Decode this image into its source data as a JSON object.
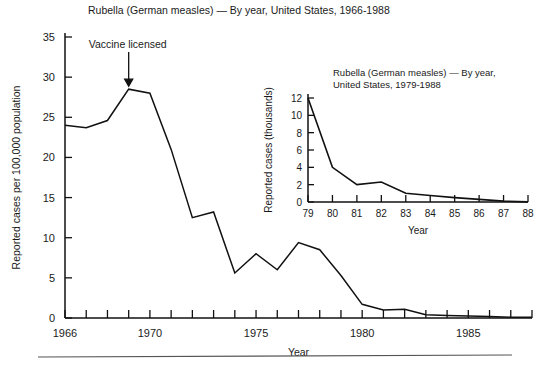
{
  "figure": {
    "background": "#ffffff",
    "ink_color": "#111111",
    "bottom_rule": true
  },
  "chart_data": [
    {
      "id": "main",
      "type": "line",
      "title": "Rubella (German measles) — By year, United States, 1966-1988",
      "xlabel": "Year",
      "ylabel": "Reported cases per 100,000 population",
      "xlim": [
        1966,
        1988
      ],
      "ylim": [
        0,
        35
      ],
      "ytick_labels": [
        "0",
        "5",
        "10",
        "15",
        "20",
        "25",
        "30",
        "35"
      ],
      "ytick_values": [
        0,
        5,
        10,
        15,
        20,
        25,
        30,
        35
      ],
      "xtick_values": [
        1966,
        1967,
        1968,
        1969,
        1970,
        1971,
        1972,
        1973,
        1974,
        1975,
        1976,
        1977,
        1978,
        1979,
        1980,
        1981,
        1982,
        1983,
        1984,
        1985,
        1986,
        1987,
        1988
      ],
      "xtick_labels": [
        {
          "value": 1966,
          "label": "1966"
        },
        {
          "value": 1970,
          "label": "1970"
        },
        {
          "value": 1975,
          "label": "1975"
        },
        {
          "value": 1980,
          "label": "1980"
        },
        {
          "value": 1985,
          "label": "1985"
        }
      ],
      "grid": false,
      "legend": false,
      "x": [
        1966,
        1967,
        1968,
        1969,
        1970,
        1971,
        1972,
        1973,
        1974,
        1975,
        1976,
        1977,
        1978,
        1979,
        1980,
        1981,
        1982,
        1983,
        1984,
        1985,
        1986,
        1987,
        1988
      ],
      "values": [
        24.0,
        23.7,
        24.6,
        28.5,
        28.0,
        21.0,
        12.5,
        13.2,
        5.6,
        8.0,
        6.0,
        9.4,
        8.5,
        5.3,
        1.7,
        1.0,
        1.1,
        0.4,
        0.3,
        0.25,
        0.2,
        0.1,
        0.1
      ],
      "annotations": [
        {
          "text": "Vaccine licensed",
          "points_to_year": 1969,
          "points_to_value": 28.5
        }
      ]
    },
    {
      "id": "inset",
      "type": "line",
      "title": "Rubella (German measles) — By year, United States, 1979-1988",
      "title_line1": "Rubella (German measles) — By year,",
      "title_line2": "United States, 1979-1988",
      "xlabel": "Year",
      "ylabel": "Reported cases (thousands)",
      "xlim": [
        1979,
        1988
      ],
      "ylim": [
        0,
        12
      ],
      "ytick_labels": [
        "0",
        "2",
        "4",
        "6",
        "8",
        "10",
        "12"
      ],
      "ytick_values": [
        0,
        2,
        4,
        6,
        8,
        10,
        12
      ],
      "xtick_values": [
        1979,
        1980,
        1981,
        1982,
        1983,
        1984,
        1985,
        1986,
        1987,
        1988
      ],
      "xtick_labels": [
        "79",
        "80",
        "81",
        "82",
        "83",
        "84",
        "85",
        "86",
        "87",
        "88"
      ],
      "grid": false,
      "legend": false,
      "x": [
        1979,
        1980,
        1981,
        1982,
        1983,
        1984,
        1985,
        1986,
        1987,
        1988
      ],
      "values": [
        12.0,
        4.0,
        2.0,
        2.3,
        1.0,
        0.75,
        0.5,
        0.3,
        0.1,
        0.02
      ]
    }
  ]
}
